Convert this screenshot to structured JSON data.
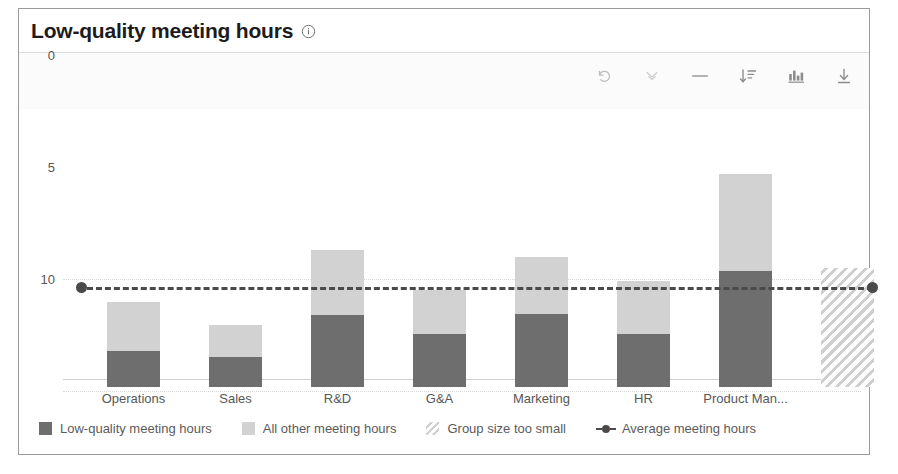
{
  "card": {
    "title": "Low-quality meeting hours",
    "info_icon": "info-circle-icon"
  },
  "toolbar": {
    "items": [
      {
        "name": "undo-icon",
        "label": "Undo"
      },
      {
        "name": "double-chevron-down-icon",
        "label": "Collapse"
      },
      {
        "name": "minus-icon",
        "label": "Minimize"
      },
      {
        "name": "sort-descending-icon",
        "label": "Sort"
      },
      {
        "name": "bar-chart-icon",
        "label": "Chart type"
      },
      {
        "name": "download-icon",
        "label": "Download"
      }
    ]
  },
  "legend": [
    {
      "name": "legend-low-quality",
      "label": "Low-quality meeting hours",
      "swatch": "solid-dark",
      "color": "#6e6e6e"
    },
    {
      "name": "legend-all-other",
      "label": "All other meeting hours",
      "swatch": "solid-light",
      "color": "#d2d2d2"
    },
    {
      "name": "legend-group-too-small",
      "label": "Group size too small",
      "swatch": "hatched",
      "color": "#d0d0d0"
    },
    {
      "name": "legend-average",
      "label": "Average meeting hours",
      "swatch": "dashed-line-dot",
      "color": "#4a4a4a"
    }
  ],
  "chart_data": {
    "type": "bar",
    "title": "Low-quality meeting hours",
    "xlabel": "",
    "ylabel": "",
    "ylim": [
      0,
      11
    ],
    "yticks": [
      0,
      5,
      10
    ],
    "ytick_labels": [
      "0",
      "5",
      "10"
    ],
    "grid": true,
    "stacked": true,
    "legend_position": "bottom",
    "categories": [
      "Operations",
      "Sales",
      "R&D",
      "G&A",
      "Marketing",
      "HR",
      "Product Man..."
    ],
    "series": [
      {
        "name": "Low-quality meeting hours",
        "color": "#6e6e6e",
        "values": [
          1.6,
          1.35,
          3.2,
          2.35,
          3.25,
          2.35,
          5.2
        ]
      },
      {
        "name": "All other meeting hours",
        "color": "#d2d2d2",
        "values": [
          2.2,
          1.4,
          2.9,
          2.0,
          2.55,
          2.4,
          4.3
        ]
      }
    ],
    "totals": [
      3.8,
      2.75,
      6.1,
      4.35,
      5.8,
      4.75,
      9.5
    ],
    "suppressed_bar": {
      "name": "Group size too small",
      "label": "",
      "value": 5.3,
      "style": "hatched"
    },
    "reference_line": {
      "name": "Average meeting hours",
      "value": 4.45,
      "style": "dashed",
      "color": "#4a4a4a",
      "end_markers": true
    }
  }
}
